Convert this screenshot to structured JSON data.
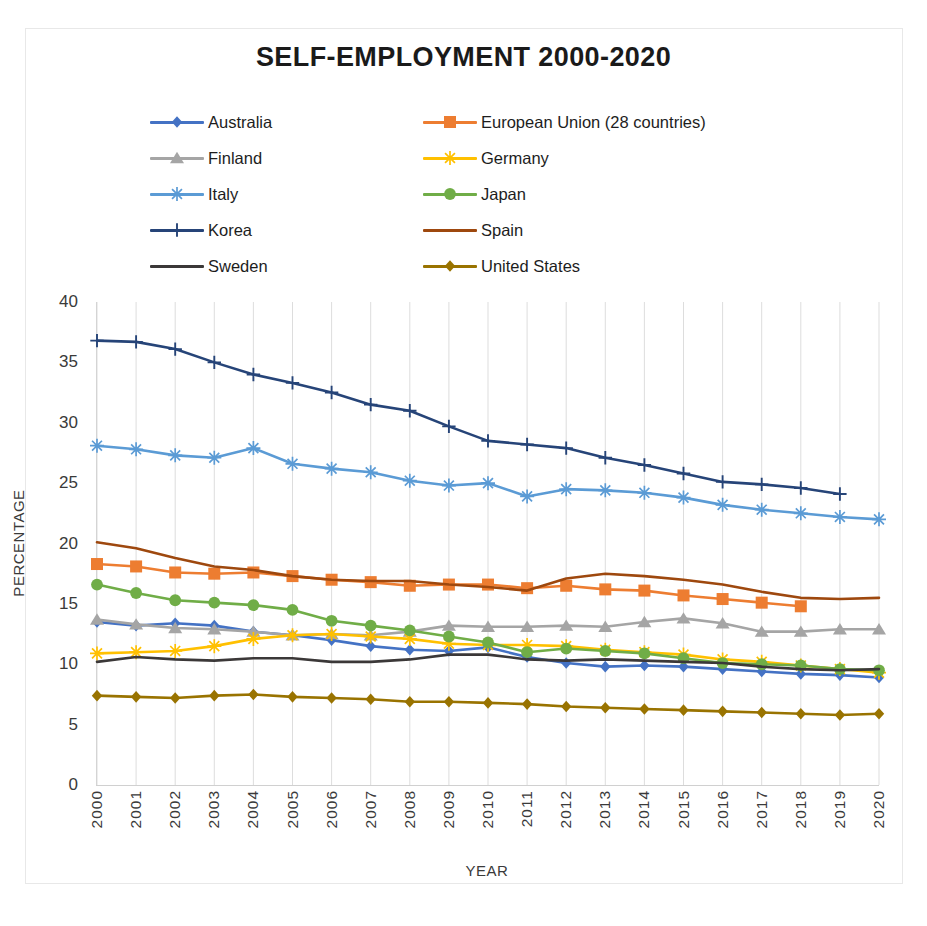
{
  "chart_data": {
    "type": "line",
    "title": "SELF-EMPLOYMENT 2000-2020",
    "xlabel": "YEAR",
    "ylabel": "PERCENTAGE",
    "xlim": [
      2000,
      2020
    ],
    "ylim": [
      0,
      40
    ],
    "ytick_step": 5,
    "yticks": [
      "0",
      "5",
      "10",
      "15",
      "20",
      "25",
      "30",
      "35",
      "40"
    ],
    "grid": "vertical-only",
    "legend_position": "top-center-two-columns",
    "categories": [
      2000,
      2001,
      2002,
      2003,
      2004,
      2005,
      2006,
      2007,
      2008,
      2009,
      2010,
      2011,
      2012,
      2013,
      2014,
      2015,
      2016,
      2017,
      2018,
      2019,
      2020
    ],
    "series": [
      {
        "name": "Australia",
        "color": "#4472C4",
        "marker": "diamond",
        "values": [
          13.5,
          13.2,
          13.4,
          13.2,
          12.7,
          12.4,
          12.0,
          11.5,
          11.2,
          11.1,
          11.4,
          10.6,
          10.1,
          9.8,
          9.9,
          9.8,
          9.6,
          9.4,
          9.2,
          9.1,
          8.9
        ]
      },
      {
        "name": "European Union (28 countries)",
        "color": "#ED7D31",
        "marker": "square",
        "values": [
          18.3,
          18.1,
          17.6,
          17.5,
          17.6,
          17.3,
          17.0,
          16.8,
          16.5,
          16.6,
          16.6,
          16.3,
          16.5,
          16.2,
          16.1,
          15.7,
          15.4,
          15.1,
          14.8,
          null,
          null
        ]
      },
      {
        "name": "Finland",
        "color": "#A5A5A5",
        "marker": "triangle",
        "values": [
          13.7,
          13.3,
          13.0,
          12.9,
          12.7,
          12.4,
          12.5,
          12.4,
          12.7,
          13.2,
          13.1,
          13.1,
          13.2,
          13.1,
          13.5,
          13.8,
          13.4,
          12.7,
          12.7,
          12.9,
          12.9
        ]
      },
      {
        "name": "Germany",
        "color": "#FFC000",
        "marker": "star",
        "values": [
          10.9,
          11.0,
          11.1,
          11.5,
          12.1,
          12.4,
          12.5,
          12.3,
          12.1,
          11.7,
          11.6,
          11.6,
          11.5,
          11.2,
          11.0,
          10.8,
          10.4,
          10.2,
          9.9,
          9.6,
          9.3
        ]
      },
      {
        "name": "Italy",
        "color": "#5B9BD5",
        "marker": "star",
        "values": [
          28.1,
          27.8,
          27.3,
          27.1,
          27.9,
          26.6,
          26.2,
          25.9,
          25.2,
          24.8,
          25.0,
          23.9,
          24.5,
          24.4,
          24.2,
          23.8,
          23.2,
          22.8,
          22.5,
          22.2,
          22.0
        ]
      },
      {
        "name": "Japan",
        "color": "#70AD47",
        "marker": "circle",
        "values": [
          16.6,
          15.9,
          15.3,
          15.1,
          14.9,
          14.5,
          13.6,
          13.2,
          12.8,
          12.3,
          11.8,
          11.0,
          11.3,
          11.1,
          10.9,
          10.5,
          10.1,
          10.0,
          9.9,
          9.6,
          9.5
        ]
      },
      {
        "name": "Korea",
        "color": "#264478",
        "marker": "plus",
        "values": [
          36.8,
          36.7,
          36.1,
          35.0,
          34.0,
          33.3,
          32.5,
          31.5,
          31.0,
          29.7,
          28.5,
          28.2,
          27.9,
          27.1,
          26.5,
          25.8,
          25.1,
          24.9,
          24.6,
          24.1,
          null
        ]
      },
      {
        "name": "Spain",
        "color": "#9E480E",
        "marker": "none",
        "values": [
          20.1,
          19.6,
          18.8,
          18.1,
          17.8,
          17.3,
          17.0,
          16.9,
          16.9,
          16.6,
          16.4,
          16.1,
          17.1,
          17.5,
          17.3,
          17.0,
          16.6,
          16.0,
          15.5,
          15.4,
          15.5
        ]
      },
      {
        "name": "Sweden",
        "color": "#3B3838",
        "marker": "none",
        "values": [
          10.2,
          10.6,
          10.4,
          10.3,
          10.5,
          10.5,
          10.2,
          10.2,
          10.4,
          10.8,
          10.8,
          10.4,
          10.3,
          10.4,
          10.3,
          10.2,
          10.1,
          9.8,
          9.6,
          9.5,
          9.6
        ]
      },
      {
        "name": "United States",
        "color": "#997300",
        "marker": "diamond",
        "values": [
          7.4,
          7.3,
          7.2,
          7.4,
          7.5,
          7.3,
          7.2,
          7.1,
          6.9,
          6.9,
          6.8,
          6.7,
          6.5,
          6.4,
          6.3,
          6.2,
          6.1,
          6.0,
          5.9,
          5.8,
          5.9
        ]
      }
    ]
  },
  "legend": {
    "left_column": [
      "Australia",
      "Finland",
      "Italy",
      "Korea",
      "Sweden"
    ],
    "right_column": [
      "European Union (28 countries)",
      "Germany",
      "Japan",
      "Spain",
      "United States"
    ]
  }
}
